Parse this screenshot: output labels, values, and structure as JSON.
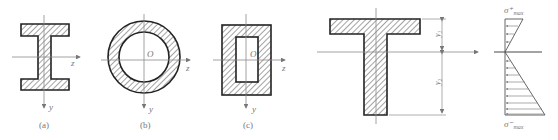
{
  "figure": {
    "type": "mechanics-of-materials cross-sections",
    "colors": {
      "outline": "#222222",
      "hatch": "#333333",
      "axis": "#8a8a8a",
      "label": "#777777"
    }
  },
  "sections": [
    {
      "id": "a",
      "shape": "I-beam",
      "caption": "(a)",
      "axis_z": "z",
      "axis_y": "y"
    },
    {
      "id": "b",
      "shape": "hollow-circle",
      "caption": "(b)",
      "origin": "O",
      "axis_z": "z",
      "axis_y": "y"
    },
    {
      "id": "c",
      "shape": "hollow-rectangle",
      "caption": "(c)",
      "origin": "O",
      "axis_z": "z",
      "axis_y": "y"
    }
  ],
  "t_section": {
    "shape": "T-beam",
    "dim_top": "y₁",
    "dim_bottom": "y₂"
  },
  "stress_diagram": {
    "label_top": "σ⁺",
    "label_top_sub": "max",
    "label_bottom": "σ⁻",
    "label_bottom_sub": "max",
    "arrow_count_top": 3,
    "arrow_count_bottom": 9
  }
}
